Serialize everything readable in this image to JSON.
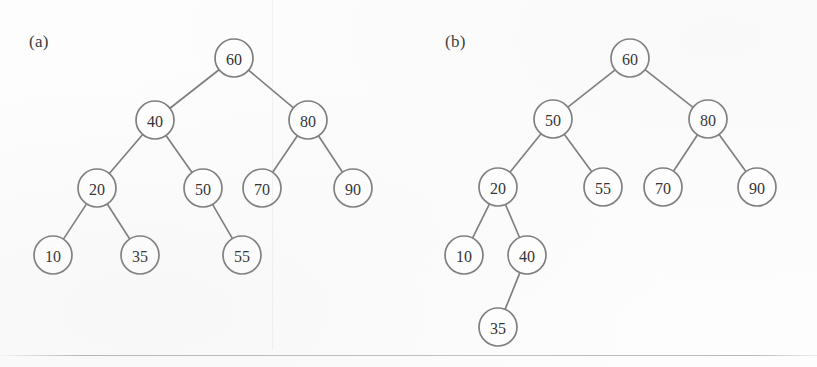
{
  "figure": {
    "width": 817,
    "height": 367,
    "background_color": "#fdfdfd",
    "stroke_color": "#7d7d7d",
    "text_color": "#2f2f2f",
    "node_radius": 19
  },
  "panels": [
    {
      "id": "panel-a",
      "label": "(a)",
      "label_x": 29,
      "label_y": 32,
      "nodes": [
        {
          "id": "a60",
          "value": "60",
          "x": 234,
          "y": 58
        },
        {
          "id": "a40",
          "value": "40",
          "x": 155,
          "y": 120
        },
        {
          "id": "a80",
          "value": "80",
          "x": 308,
          "y": 120
        },
        {
          "id": "a20",
          "value": "20",
          "x": 97,
          "y": 188
        },
        {
          "id": "a50",
          "value": "50",
          "x": 203,
          "y": 188
        },
        {
          "id": "a70",
          "value": "70",
          "x": 262,
          "y": 188
        },
        {
          "id": "a90",
          "value": "90",
          "x": 353,
          "y": 188
        },
        {
          "id": "a10",
          "value": "10",
          "x": 53,
          "y": 255
        },
        {
          "id": "a35",
          "value": "35",
          "x": 140,
          "y": 255
        },
        {
          "id": "a55",
          "value": "55",
          "x": 242,
          "y": 255
        }
      ],
      "edges": [
        {
          "from": "a60",
          "to": "a40"
        },
        {
          "from": "a60",
          "to": "a80"
        },
        {
          "from": "a40",
          "to": "a20"
        },
        {
          "from": "a40",
          "to": "a50"
        },
        {
          "from": "a80",
          "to": "a70"
        },
        {
          "from": "a80",
          "to": "a90"
        },
        {
          "from": "a20",
          "to": "a10"
        },
        {
          "from": "a20",
          "to": "a35"
        },
        {
          "from": "a50",
          "to": "a55"
        }
      ]
    },
    {
      "id": "panel-b",
      "label": "(b)",
      "label_x": 445,
      "label_y": 32,
      "nodes": [
        {
          "id": "b60",
          "value": "60",
          "x": 630,
          "y": 58
        },
        {
          "id": "b50",
          "value": "50",
          "x": 553,
          "y": 119
        },
        {
          "id": "b80",
          "value": "80",
          "x": 708,
          "y": 119
        },
        {
          "id": "b20",
          "value": "20",
          "x": 498,
          "y": 187
        },
        {
          "id": "b55",
          "value": "55",
          "x": 603,
          "y": 187
        },
        {
          "id": "b70",
          "value": "70",
          "x": 663,
          "y": 187
        },
        {
          "id": "b90",
          "value": "90",
          "x": 757,
          "y": 187
        },
        {
          "id": "b10",
          "value": "10",
          "x": 464,
          "y": 255
        },
        {
          "id": "b40",
          "value": "40",
          "x": 527,
          "y": 255
        },
        {
          "id": "b35",
          "value": "35",
          "x": 498,
          "y": 327
        }
      ],
      "edges": [
        {
          "from": "b60",
          "to": "b50"
        },
        {
          "from": "b60",
          "to": "b80"
        },
        {
          "from": "b50",
          "to": "b20"
        },
        {
          "from": "b50",
          "to": "b55"
        },
        {
          "from": "b80",
          "to": "b70"
        },
        {
          "from": "b80",
          "to": "b90"
        },
        {
          "from": "b20",
          "to": "b10"
        },
        {
          "from": "b20",
          "to": "b40"
        },
        {
          "from": "b40",
          "to": "b35"
        }
      ]
    }
  ],
  "artifacts": {
    "bottom_rule_y": 355,
    "column_gutter_x": 272
  }
}
